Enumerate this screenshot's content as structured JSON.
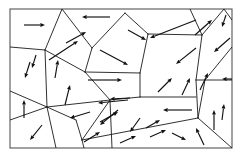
{
  "figure": {
    "width": 241,
    "height": 159,
    "background_color": "#ffffff",
    "frame_color": "#555555",
    "boundary_color": "#1a1a1a",
    "arrow_color": "#111111",
    "frame": {
      "x": 10,
      "y": 9,
      "width": 222,
      "height": 139
    }
  },
  "chart_data": {
    "type": "diagram",
    "xlabel": "",
    "ylabel": "",
    "grain_count": 22,
    "arrow_count": 37,
    "grain_boundaries": [
      {
        "name": "boundary-left-upper-diagonal",
        "points": "10,47 45,50"
      },
      {
        "name": "boundary-left-triple-to-top",
        "points": "45,50 62,9"
      },
      {
        "name": "boundary-left-vertical",
        "points": "45,50 47,107"
      },
      {
        "name": "boundary-left-lower-diagonal",
        "points": "10,91 47,107"
      },
      {
        "name": "boundary-left-bottom-slope",
        "points": "47,107 10,120"
      },
      {
        "name": "boundary-lowerleft-to-bottom",
        "points": "47,107 56,148"
      },
      {
        "name": "boundary-center-pentagon-top",
        "points": "92,48 125,13"
      },
      {
        "name": "boundary-center-pentagon-left",
        "points": "92,48 85,72"
      },
      {
        "name": "boundary-center-left-join",
        "points": "85,72 45,50"
      },
      {
        "name": "boundary-center-pentagon-bottom",
        "points": "85,72 140,73"
      },
      {
        "name": "boundary-center-pentagon-right",
        "points": "140,73 148,34"
      },
      {
        "name": "boundary-center-pentagon-topright",
        "points": "148,34 125,13"
      },
      {
        "name": "boundary-upper-mid-right",
        "points": "148,34 202,35"
      },
      {
        "name": "boundary-junction-up-left",
        "points": "202,35 190,9"
      },
      {
        "name": "boundary-junction-up-right",
        "points": "202,35 224,9"
      },
      {
        "name": "boundary-junction-down",
        "points": "202,35 196,80"
      },
      {
        "name": "boundary-right-junction-in",
        "points": "196,80 232,80"
      },
      {
        "name": "boundary-right-mid-down",
        "points": "196,80 198,118"
      },
      {
        "name": "boundary-right-lower-diag",
        "points": "198,118 232,148"
      },
      {
        "name": "boundary-right-vertical-up",
        "points": "198,118 205,80"
      },
      {
        "name": "boundary-mid-horizontal",
        "points": "140,97 196,97"
      },
      {
        "name": "boundary-mid-pentagon-left",
        "points": "140,73 140,97"
      },
      {
        "name": "boundary-center-bottom-left",
        "points": "140,97 110,100"
      },
      {
        "name": "boundary-triangle-left",
        "points": "110,100 82,140"
      },
      {
        "name": "boundary-triangle-bottom",
        "points": "82,140 198,118"
      },
      {
        "name": "boundary-triangle-down",
        "points": "110,100 112,148"
      },
      {
        "name": "boundary-center-to-mid",
        "points": "85,72 110,100"
      },
      {
        "name": "boundary-lower-left-mid",
        "points": "47,107 110,100"
      },
      {
        "name": "boundary-lower-left-vert",
        "points": "82,140 76,120"
      },
      {
        "name": "boundary-lower-left-join",
        "points": "76,120 47,107"
      },
      {
        "name": "boundary-bottom-mid-down",
        "points": "82,140 84,148"
      },
      {
        "name": "boundary-top-right-edge",
        "points": "224,9 232,20"
      },
      {
        "name": "boundary-upper-right-corner",
        "points": "232,47 205,80"
      },
      {
        "name": "boundary-center-upper-join",
        "points": "92,48 62,9"
      }
    ],
    "arrows": [
      {
        "name": "arrow-upper-left-right",
        "x1": 24,
        "y1": 25,
        "x2": 45,
        "y2": 25,
        "direction": "right"
      },
      {
        "name": "arrow-top-center-left",
        "x1": 110,
        "y1": 17,
        "x2": 82,
        "y2": 17,
        "direction": "left"
      },
      {
        "name": "arrow-left-upper-diag",
        "x1": 49,
        "y1": 60,
        "x2": 78,
        "y2": 41,
        "direction": "up-right"
      },
      {
        "name": "arrow-left-mid-down",
        "x1": 30,
        "y1": 62,
        "x2": 25,
        "y2": 78,
        "direction": "down-left"
      },
      {
        "name": "arrow-left-lower-up",
        "x1": 24,
        "y1": 118,
        "x2": 24,
        "y2": 100,
        "direction": "up"
      },
      {
        "name": "arrow-left-bottom-down",
        "x1": 42,
        "y1": 125,
        "x2": 30,
        "y2": 140,
        "direction": "down-left"
      },
      {
        "name": "arrow-leftmid-up",
        "x1": 65,
        "y1": 105,
        "x2": 70,
        "y2": 85,
        "direction": "up"
      },
      {
        "name": "arrow-lowleft-left",
        "x1": 90,
        "y1": 112,
        "x2": 70,
        "y2": 118,
        "direction": "left"
      },
      {
        "name": "arrow-bottom-left-upright",
        "x1": 84,
        "y1": 142,
        "x2": 100,
        "y2": 132,
        "direction": "up-right"
      },
      {
        "name": "arrow-center-pent-downright",
        "x1": 100,
        "y1": 50,
        "x2": 128,
        "y2": 65,
        "direction": "down-right"
      },
      {
        "name": "arrow-center-mid-right",
        "x1": 88,
        "y1": 80,
        "x2": 122,
        "y2": 80,
        "direction": "right"
      },
      {
        "name": "arrow-center-quad-downright",
        "x1": 128,
        "y1": 30,
        "x2": 146,
        "y2": 40,
        "direction": "down-right"
      },
      {
        "name": "arrow-center-lower-left",
        "x1": 128,
        "y1": 100,
        "x2": 98,
        "y2": 103,
        "direction": "left"
      },
      {
        "name": "arrow-triangle-downleft",
        "x1": 118,
        "y1": 110,
        "x2": 100,
        "y2": 125,
        "direction": "down-left"
      },
      {
        "name": "arrow-triangle-down",
        "x1": 140,
        "y1": 118,
        "x2": 130,
        "y2": 132,
        "direction": "down-left"
      },
      {
        "name": "arrow-bottom-center-right",
        "x1": 150,
        "y1": 137,
        "x2": 166,
        "y2": 130,
        "direction": "up-right"
      },
      {
        "name": "arrow-upper-right-diag-left",
        "x1": 196,
        "y1": 20,
        "x2": 150,
        "y2": 38,
        "direction": "down-left"
      },
      {
        "name": "arrow-upperright-upright",
        "x1": 195,
        "y1": 35,
        "x2": 212,
        "y2": 20,
        "direction": "up-right"
      },
      {
        "name": "arrow-topright-down",
        "x1": 226,
        "y1": 15,
        "x2": 222,
        "y2": 27,
        "direction": "down"
      },
      {
        "name": "arrow-right-upper-downleft",
        "x1": 230,
        "y1": 38,
        "x2": 214,
        "y2": 52,
        "direction": "down-left"
      },
      {
        "name": "arrow-right-mid-left",
        "x1": 236,
        "y1": 79,
        "x2": 222,
        "y2": 79,
        "direction": "left"
      },
      {
        "name": "arrow-right-quad-downleft",
        "x1": 196,
        "y1": 48,
        "x2": 176,
        "y2": 64,
        "direction": "down-left"
      },
      {
        "name": "arrow-right-lower-upright",
        "x1": 200,
        "y1": 90,
        "x2": 208,
        "y2": 73,
        "direction": "up-right"
      },
      {
        "name": "arrow-right-bottom-up",
        "x1": 214,
        "y1": 130,
        "x2": 214,
        "y2": 110,
        "direction": "up"
      },
      {
        "name": "arrow-rightmid-left",
        "x1": 192,
        "y1": 110,
        "x2": 163,
        "y2": 110,
        "direction": "left"
      },
      {
        "name": "arrow-bottomright-upleft",
        "x1": 204,
        "y1": 145,
        "x2": 196,
        "y2": 128,
        "direction": "up-left"
      },
      {
        "name": "arrow-bottomright-downright",
        "x1": 172,
        "y1": 133,
        "x2": 186,
        "y2": 140,
        "direction": "down-right"
      },
      {
        "name": "arrow-mid-right-upright",
        "x1": 158,
        "y1": 92,
        "x2": 172,
        "y2": 78,
        "direction": "up-right"
      },
      {
        "name": "arrow-center-right-up",
        "x1": 182,
        "y1": 95,
        "x2": 190,
        "y2": 78,
        "direction": "up"
      },
      {
        "name": "arrow-centerleft-upright",
        "x1": 66,
        "y1": 43,
        "x2": 86,
        "y2": 32,
        "direction": "up-right"
      },
      {
        "name": "arrow-left-top-diag",
        "x1": 55,
        "y1": 78,
        "x2": 58,
        "y2": 60,
        "direction": "up"
      },
      {
        "name": "arrow-midleft-upright",
        "x1": 100,
        "y1": 122,
        "x2": 118,
        "y2": 112,
        "direction": "up-right"
      },
      {
        "name": "arrow-bottom-upright",
        "x1": 120,
        "y1": 143,
        "x2": 136,
        "y2": 136,
        "direction": "up-right"
      },
      {
        "name": "arrow-lower-mid-left",
        "x1": 130,
        "y1": 98,
        "x2": 110,
        "y2": 99,
        "direction": "left"
      },
      {
        "name": "arrow-upperleft-small-down",
        "x1": 36,
        "y1": 55,
        "x2": 32,
        "y2": 68,
        "direction": "down"
      },
      {
        "name": "arrow-right-edge-up",
        "x1": 222,
        "y1": 120,
        "x2": 224,
        "y2": 104,
        "direction": "up"
      },
      {
        "name": "arrow-centerlow-upright",
        "x1": 146,
        "y1": 128,
        "x2": 160,
        "y2": 120,
        "direction": "up-right"
      }
    ]
  }
}
